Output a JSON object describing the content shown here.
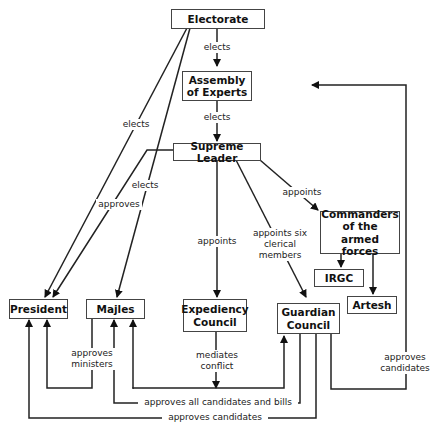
{
  "nodes": {
    "electorate": "Electorate",
    "assembly": "Assembly\nof Experts",
    "supreme_leader": "Supreme Leader",
    "commanders": "Commanders\nof the\narmed forces",
    "irgc": "IRGC",
    "artesh": "Artesh",
    "president": "President",
    "majles": "Majles",
    "expediency": "Expediency\nCouncil",
    "guardian": "Guardian\nCouncil"
  },
  "edge_labels": {
    "electorate_assembly": "elects",
    "assembly_leader": "elects",
    "electorate_president": "elects",
    "electorate_majles": "elects",
    "leader_president": "approves",
    "leader_expediency": "appoints",
    "leader_guardian": "appoints six\nclerical\nmembers",
    "leader_commanders": "appoints",
    "majles_president": "approves\nministers",
    "expediency_mediates": "mediates\nconflict",
    "guardian_majles": "approves all candidates and bills",
    "guardian_president": "approves candidates",
    "guardian_assembly": "approves\ncandidates"
  }
}
